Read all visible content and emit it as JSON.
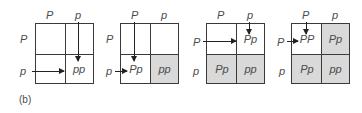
{
  "caption": "(b)",
  "colors": {
    "shade": "#d9d9d9",
    "line": "#3a3a3a",
    "text": "#4a4a4a"
  },
  "panels": [
    {
      "col_headers": [
        "P",
        "p"
      ],
      "row_headers": [
        "P",
        "p"
      ],
      "cells": [
        "",
        "",
        "",
        "pp"
      ],
      "shaded": [
        false,
        false,
        false,
        false
      ],
      "arrows": "column p down and row p across into pp"
    },
    {
      "col_headers": [
        "P",
        "p"
      ],
      "row_headers": [
        "P",
        "p"
      ],
      "cells": [
        "",
        "",
        "Pp",
        "pp"
      ],
      "shaded": [
        false,
        false,
        false,
        true
      ],
      "arrows": "column P down and row p across into Pp"
    },
    {
      "col_headers": [
        "P",
        "p"
      ],
      "row_headers": [
        "P",
        "p"
      ],
      "cells": [
        "",
        "Pp",
        "Pp",
        "pp"
      ],
      "shaded": [
        false,
        false,
        true,
        true
      ],
      "arrows": "column p down and row P across into Pp"
    },
    {
      "col_headers": [
        "P",
        "p"
      ],
      "row_headers": [
        "P",
        "p"
      ],
      "cells": [
        "PP",
        "Pp",
        "Pp",
        "pp"
      ],
      "shaded": [
        false,
        true,
        true,
        true
      ],
      "arrows": "column P down and row P across into PP"
    }
  ]
}
